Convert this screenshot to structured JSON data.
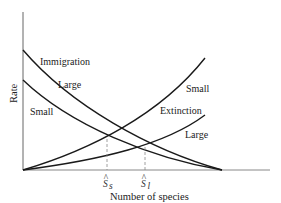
{
  "diagram": {
    "axes": {
      "x_label": "Number of species",
      "y_label": "Rate"
    },
    "curve_group_labels": {
      "immigration": "Immigration",
      "extinction": "Extinction"
    },
    "curves": [
      {
        "id": "immigration-large",
        "group": "Immigration",
        "label": "Large"
      },
      {
        "id": "immigration-small",
        "group": "Immigration",
        "label": "Small"
      },
      {
        "id": "extinction-small",
        "group": "Extinction",
        "label": "Small"
      },
      {
        "id": "extinction-large",
        "group": "Extinction",
        "label": "Large"
      }
    ],
    "equilibria": [
      {
        "id": "s-hat-small",
        "symbol": "S",
        "subscript": "s",
        "hat": "^"
      },
      {
        "id": "s-hat-large",
        "symbol": "S",
        "subscript": "l",
        "hat": "^"
      }
    ],
    "colors": {
      "curve": "#1a1a1a",
      "axis": "#555555",
      "dashed": "#888888",
      "text": "#222222"
    }
  }
}
